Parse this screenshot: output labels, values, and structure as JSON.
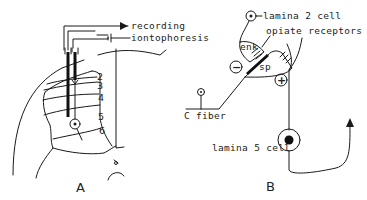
{
  "figure": {
    "panel_a": {
      "label": "A",
      "electrode_labels": {
        "recording": "recording",
        "iontophoresis": "iontophoresis"
      },
      "lamina_numbers": [
        "2",
        "3",
        "4",
        "5",
        "6"
      ]
    },
    "panel_b": {
      "label": "B",
      "labels": {
        "lamina2_cell": "lamina 2 cell",
        "opiate_receptors": "opiate receptors",
        "enk": "enk",
        "sp": "sp",
        "inhibition": "−",
        "excitation": "+",
        "c_fiber": "C fiber",
        "lamina5_cell": "lamina 5 cell"
      }
    },
    "colors": {
      "ink": "#1a1a1a",
      "background": "#ffffff"
    }
  }
}
